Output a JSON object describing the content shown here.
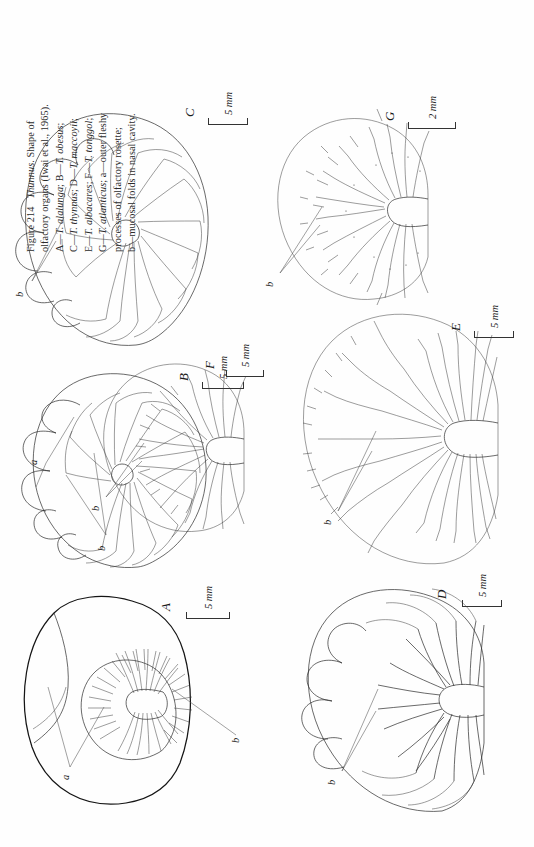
{
  "figure": {
    "number": "Figure 214",
    "genus": "Thunnus",
    "title_rest": ". Shape of",
    "caption_lines": [
      "Figure 214   Thunnus. Shape of",
      "olfactory organs (Iwai et al., 1965).",
      "A—T. alalunga; B—T. obesus;",
      "C—T. thynnus; D—T. maccoyii;",
      "E—T. albacares; F—T. tonggol;",
      "G—T. atlanticus; a—outer fleshy",
      "processes of olfactory rosette;",
      "b—mucosal folds in nasal cavity."
    ],
    "caption_parts": {
      "l1_pre": "Figure 214",
      "l1_italic": "Thunnus",
      "l1_post": ". Shape of",
      "l2": "olfactory organs (Iwai et al., 1965).",
      "l3_a": "A—",
      "l3_ai": "T. alalunga",
      "l3_b": "; B—",
      "l3_bi": "T. obesus",
      "l3_end": ";",
      "l4_a": "C—",
      "l4_ai": "T. thynnus",
      "l4_b": "; D—",
      "l4_bi": "T. maccoyii",
      "l4_end": ";",
      "l5_a": "E—",
      "l5_ai": "T. albacares",
      "l5_b": "; F—",
      "l5_bi": "T. tonggol",
      "l5_end": ";",
      "l6_a": "G—",
      "l6_ai": "T. atlanticus",
      "l6_b": "; a—outer fleshy",
      "l7": "processes of olfactory rosette;",
      "l8": "b—mucosal folds in nasal cavity."
    },
    "source_citation": "Iwai et al., 1965",
    "ink_color": "#2a2a2a",
    "background_color": "#ffffff"
  },
  "legend_keys": [
    {
      "key": "a",
      "meaning": "outer fleshy processes of olfactory rosette"
    },
    {
      "key": "b",
      "meaning": "mucosal folds in nasal cavity"
    }
  ],
  "panels": [
    {
      "id": "A",
      "label": "A",
      "species": "T. alalunga",
      "scale": "5 mm",
      "annotations": [
        "a",
        "b"
      ],
      "description": "olfactory organ with broad outer membrane and small central rosette bearing spiky fleshy processes"
    },
    {
      "id": "B",
      "label": "B",
      "species": "T. obesus",
      "scale": "5 mm",
      "annotations": [
        "a",
        "b"
      ],
      "description": "rounded rosette with radiating lamellae and large outer fleshy lobes at upper margin"
    },
    {
      "id": "C",
      "label": "C",
      "species": "T. thynnus",
      "scale": "5 mm",
      "annotations": [
        "b"
      ],
      "description": "broad oval rosette with many radiating lamellae and lobed upper border"
    },
    {
      "id": "D",
      "label": "D",
      "species": "T. maccoyii",
      "scale": "5 mm",
      "annotations": [
        "b"
      ],
      "description": "fan shaped rosette with thick radiating folds and central raphe"
    },
    {
      "id": "E",
      "label": "E",
      "species": "T. albacares",
      "scale": "5 mm",
      "annotations": [
        "b"
      ],
      "description": "large rosette with dense fine lamellae and serrated outer margin"
    },
    {
      "id": "F",
      "label": "F",
      "species": "T. tonggol",
      "scale": "5 mm",
      "annotations": [
        "b"
      ],
      "description": "small fan rosette with fine radiating lamellae and frilled edge"
    },
    {
      "id": "G",
      "label": "G",
      "species": "T. atlanticus",
      "scale": "2 mm",
      "annotations": [
        "b"
      ],
      "description": "small rounded rosette with very fine frilled lamellae"
    }
  ],
  "scale_bars": [
    {
      "panel": "A",
      "text": "5 mm"
    },
    {
      "panel": "B",
      "text": "5 mm"
    },
    {
      "panel": "C",
      "text": "5 mm"
    },
    {
      "panel": "D",
      "text": "5 mm"
    },
    {
      "panel": "E",
      "text": "5 mm"
    },
    {
      "panel": "F",
      "text": "5 mm"
    },
    {
      "panel": "G",
      "text": "2 mm"
    }
  ]
}
